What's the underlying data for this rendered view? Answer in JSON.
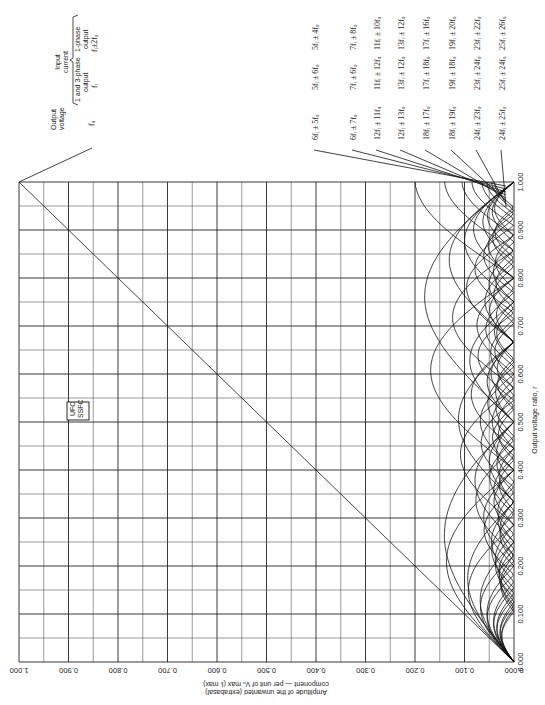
{
  "chart_data": {
    "type": "line",
    "orientation": "rotated-90",
    "title": "",
    "xlabel": "Output voltage ratio, r",
    "ylabel": "Amplitude of the unwanted (extrabasal) component — per unit of V_O max (I_I max)",
    "xlim": [
      0.0,
      1.0
    ],
    "ylim": [
      0.0,
      1.0
    ],
    "x_ticks": [
      "0.000",
      "0.100",
      "0.200",
      "0.300",
      "0.400",
      "0.500",
      "0.600",
      "0.700",
      "0.800",
      "0.900",
      "1.000"
    ],
    "y_ticks": [
      "0.000",
      "0.100",
      "0.200",
      "0.300",
      "0.400",
      "0.500",
      "0.600",
      "0.700",
      "0.800",
      "0.900",
      "1.000"
    ],
    "grid": true,
    "legend_box": [
      "UFC",
      "SSFC"
    ],
    "header": {
      "output_voltage": "Output voltage",
      "output_voltage_freq": "f_O",
      "input_current": "Input current",
      "col_three_phase": "1 and 3-phase output",
      "col_three_phase_freq": "f_I",
      "col_single_phase": "1-phase output",
      "col_single_phase_freq": "f_I ± 2f_O"
    },
    "series": [
      {
        "name": "f_O (wanted, UFC/SSFC diagonal)",
        "shape": "line",
        "points": [
          [
            0.0,
            0.0
          ],
          [
            1.0,
            1.0
          ]
        ]
      },
      {
        "name": "6f_I ± 5f_O",
        "voltage": "6f_I ± 5f_O",
        "input_3ph": "5f_I ± 6f_O",
        "input_1ph": "5f_I ± 4f_O",
        "peak": 0.2,
        "lobes": 2
      },
      {
        "name": "6f_I ± 7f_O",
        "voltage": "6f_I ± 7f_O",
        "input_3ph": "7f_I ± 6f_O",
        "input_1ph": "7f_I ± 8f_O",
        "peak": 0.14,
        "lobes": 3
      },
      {
        "name": "12f_I ± 11f_O",
        "voltage": "12f_I ± 11f_O",
        "input_3ph": "11f_I ± 12f_O",
        "input_1ph": "11f_I ± 10f_O",
        "peak": 0.105,
        "lobes": 4
      },
      {
        "name": "12f_I ± 13f_O",
        "voltage": "12f_I ± 13f_O",
        "input_3ph": "13f_I ± 12f_O",
        "input_1ph": "13f_I ± 12f_O",
        "peak": 0.085,
        "lobes": 5
      },
      {
        "name": "18f_I ± 17f_O",
        "voltage": "18f_I ± 17f_O",
        "input_3ph": "17f_I ± 18f_O",
        "input_1ph": "17f_I ± 16f_O",
        "peak": 0.065,
        "lobes": 6
      },
      {
        "name": "18f_I ± 19f_O",
        "voltage": "18f_I ± 19f_O",
        "input_3ph": "19f_I ± 18f_O",
        "input_1ph": "19f_I ± 20f_O",
        "peak": 0.055,
        "lobes": 7
      },
      {
        "name": "24f_I ± 23f_O",
        "voltage": "24f_I ± 23f_O",
        "input_3ph": "23f_I ± 24f_O",
        "input_1ph": "23f_I ± 22f_O",
        "peak": 0.045,
        "lobes": 8
      },
      {
        "name": "24f_I ± 25f_O",
        "voltage": "24f_I ± 25f_O",
        "input_3ph": "25f_I ± 24f_O",
        "input_1ph": "25f_I ± 26f_O",
        "peak": 0.04,
        "lobes": 9
      }
    ]
  },
  "labels": {
    "ufc": "UFC",
    "ssfc": "SSFC",
    "output_voltage_l1": "Output",
    "output_voltage_l2": "voltage",
    "fo": "fₒ",
    "input_l1": "Input",
    "input_l2": "current",
    "three_l1": "1 and 3-phase",
    "three_l2": "output",
    "three_f": "fᵢ",
    "single_l1": "1-phase",
    "single_l2": "output",
    "single_f": "fᵢ±2fₒ",
    "xlabel": "Output voltage ratio, r",
    "ylabel_l1": "Amplitude of the unwanted (extrabasal)",
    "ylabel_l2": "component — per unit of Vₒ max (Iᵢ max)"
  }
}
